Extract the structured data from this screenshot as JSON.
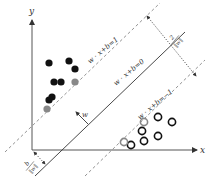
{
  "diagram": {
    "type": "svm-max-margin",
    "axes": {
      "x_label": "x",
      "y_label": "y"
    },
    "hyperplanes": {
      "positive": "w · x+b=1",
      "decision": "w · x+b=0",
      "negative": "w · x+b=−1"
    },
    "normal_vector_label": "w",
    "margin_label": {
      "numerator": "2",
      "denominator": "‖w‖"
    },
    "offset_label": {
      "numerator": "b",
      "denominator": "‖w‖"
    },
    "classes": {
      "positive": {
        "marker": "filled-circle",
        "color": "#111111",
        "support_color": "#888888",
        "count": 7,
        "support_vectors": 2
      },
      "negative": {
        "marker": "open-circle",
        "color": "#111111",
        "support_color": "#888888",
        "count": 6,
        "support_vectors": 2
      }
    }
  }
}
